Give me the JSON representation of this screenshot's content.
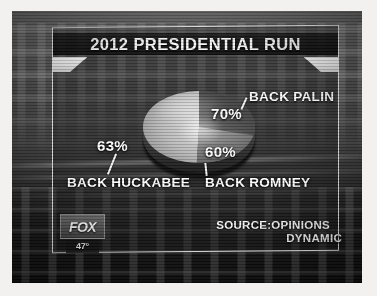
{
  "broadcast": {
    "network_bug": "FOX",
    "temperature": "47°"
  },
  "graphic": {
    "title": "2012 PRESIDENTIAL RUN",
    "subtitle": "GOP CANDIDATES",
    "source_line1": "SOURCE:OPINIONS",
    "source_line2": "DYNAMIC"
  },
  "chart_data": {
    "type": "pie",
    "title": "2012 PRESIDENTIAL RUN",
    "subtitle": "GOP CANDIDATES",
    "categories": [
      "BACK PALIN",
      "BACK HUCKABEE",
      "BACK ROMNEY"
    ],
    "values": [
      70,
      63,
      60
    ],
    "value_labels": [
      "70%",
      "63%",
      "60%"
    ],
    "unit": "%",
    "note": "Percentages sum to 193% — slices are drawn as if they were parts of a whole, a well-known misleading pie chart.",
    "legend": "inline-callouts",
    "grid": false,
    "source": "OPINIONS DYNAMIC",
    "slices": [
      {
        "label": "BACK PALIN",
        "value": 70,
        "display": "70%",
        "color": "#5a5648"
      },
      {
        "label": "BACK HUCKABEE",
        "value": 63,
        "display": "63%",
        "color": "#bdb8a6"
      },
      {
        "label": "BACK ROMNEY",
        "value": 60,
        "display": "60%",
        "color": "#9b9685"
      }
    ]
  },
  "colors": {
    "frame_border": "#e9e7e0",
    "title_bar": "#141413",
    "subtitle_band": "#efece4",
    "label_text": "#fcfbf6"
  }
}
